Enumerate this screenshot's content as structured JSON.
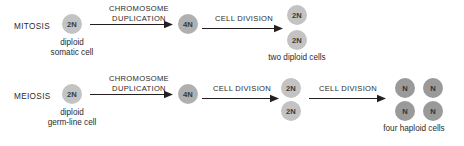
{
  "diagram": {
    "colors": {
      "background": "#ffffff",
      "text": "#231f20",
      "cell_2n": "#c3c3c3",
      "cell_4n": "#b0b0b0",
      "cell_n": "#9a9a9a",
      "arrow": "#231f20"
    },
    "rows": [
      {
        "id": "mitosis",
        "process_label": "MITOSIS",
        "start_cell": {
          "label": "2N",
          "caption_line1": "diploid",
          "caption_line2": "somatic cell"
        },
        "step1_label_line1": "CHROMOSOME",
        "step1_label_line2": "DUPLICATION",
        "mid_cell": {
          "label": "4N"
        },
        "step2_label_line1": "CELL DIVISION",
        "output_cells": [
          {
            "label": "2N"
          },
          {
            "label": "2N"
          }
        ],
        "output_caption": "two diploid cells"
      },
      {
        "id": "meiosis",
        "process_label": "MEIOSIS",
        "start_cell": {
          "label": "2N",
          "caption_line1": "diploid",
          "caption_line2": "germ-line cell"
        },
        "step1_label_line1": "CHROMOSOME",
        "step1_label_line2": "DUPLICATION",
        "mid_cell": {
          "label": "4N"
        },
        "step2_label_line1": "CELL DIVISION",
        "intermediate_cells": [
          {
            "label": "2N"
          },
          {
            "label": "2N"
          }
        ],
        "step3_label_line1": "CELL DIVISION",
        "output_cells": [
          {
            "label": "N"
          },
          {
            "label": "N"
          },
          {
            "label": "N"
          },
          {
            "label": "N"
          }
        ],
        "output_caption": "four haploid cells"
      }
    ]
  }
}
